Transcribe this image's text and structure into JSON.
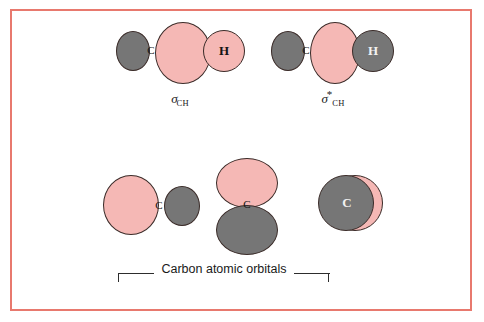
{
  "figure": {
    "border_color": "#e8796e",
    "background": "#ffffff",
    "orbital_pink": "#f5b8b5",
    "orbital_gray": "#767676",
    "outline_color": "#3a2b28"
  },
  "molecular_orbitals": [
    {
      "name": "sigma-ch-bonding",
      "caption_symbol": "σ",
      "caption_star": "",
      "caption_subscript": "CH",
      "lobes": [
        {
          "name": "carbon-back-lobe",
          "phase": "gray",
          "label": ""
        },
        {
          "name": "carbon-front-lobe",
          "phase": "pink",
          "label": ""
        },
        {
          "name": "hydrogen-lobe",
          "phase": "pink",
          "label": "H"
        }
      ],
      "carbon_label": "C",
      "hydrogen_label": "H"
    },
    {
      "name": "sigma-ch-antibonding",
      "caption_symbol": "σ",
      "caption_star": "*",
      "caption_subscript": "CH",
      "lobes": [
        {
          "name": "carbon-back-lobe",
          "phase": "gray",
          "label": ""
        },
        {
          "name": "carbon-front-lobe",
          "phase": "pink",
          "label": ""
        },
        {
          "name": "hydrogen-lobe",
          "phase": "gray",
          "label": "H"
        }
      ],
      "carbon_label": "C",
      "hydrogen_label": "H"
    }
  ],
  "atomic_orbitals": [
    {
      "name": "carbon-p-orbital-horizontal",
      "orientation": "horizontal",
      "label": "C",
      "lobe_positive": "pink",
      "lobe_negative": "gray"
    },
    {
      "name": "carbon-p-orbital-vertical",
      "orientation": "vertical",
      "label": "C",
      "lobe_positive": "pink",
      "lobe_negative": "gray"
    },
    {
      "name": "carbon-p-orbital-perpendicular",
      "orientation": "out-of-plane",
      "label": "C",
      "lobe_positive": "pink",
      "lobe_negative": "gray"
    }
  ],
  "bracket": {
    "label": "Carbon atomic orbitals"
  }
}
